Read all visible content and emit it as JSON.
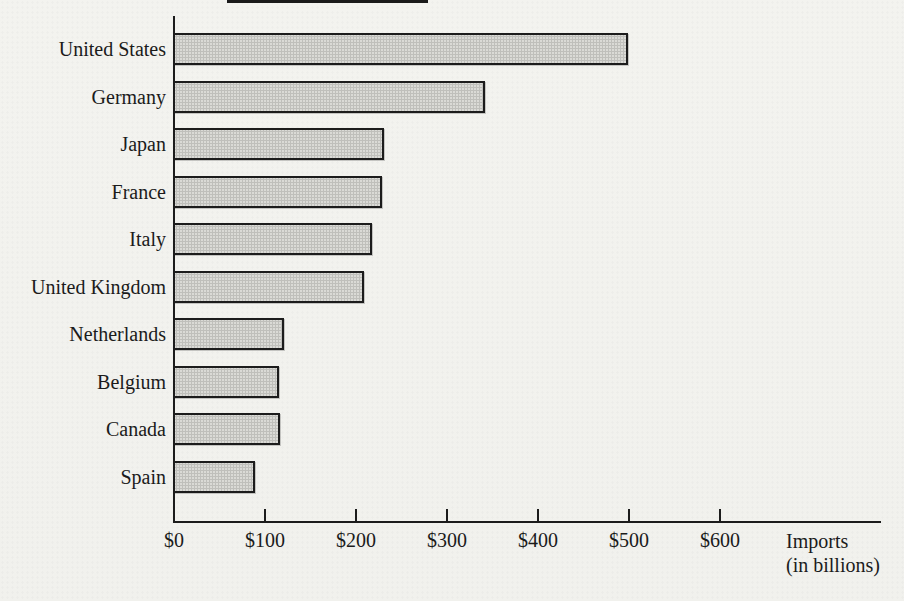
{
  "chart_data": {
    "type": "bar",
    "orientation": "horizontal",
    "title": "",
    "categories": [
      "United States",
      "Germany",
      "Japan",
      "France",
      "Italy",
      "United Kingdom",
      "Netherlands",
      "Belgium",
      "Canada",
      "Spain"
    ],
    "values": [
      500,
      343,
      232,
      230,
      219,
      210,
      122,
      117,
      118,
      90
    ],
    "xlabel": "Imports (in billions)",
    "xlabel_line1": "Imports",
    "xlabel_line2": "(in billions)",
    "ylabel": "",
    "xlim": [
      0,
      600
    ],
    "x_ticks": [
      0,
      100,
      200,
      300,
      400,
      500,
      600
    ],
    "x_tick_labels": [
      "$0",
      "$100",
      "$200",
      "$300",
      "$400",
      "$500",
      "$600"
    ],
    "grid": false,
    "legend": "none",
    "colors": {
      "bar_fill": "#dadad6",
      "bar_border": "#1c1c1c",
      "axis": "#1c1c1c",
      "text": "#1b1b1b",
      "background": "#f2f2ee"
    }
  }
}
